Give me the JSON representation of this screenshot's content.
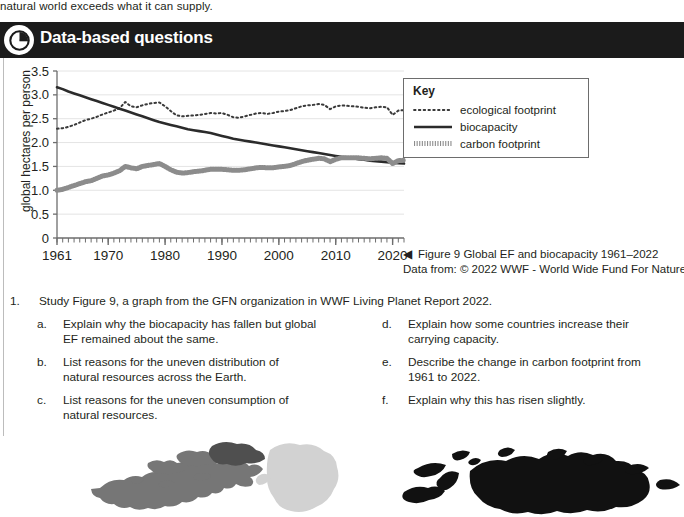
{
  "top_text": "natural world exceeds what it can supply.",
  "header": {
    "title": "Data-based questions",
    "icon": "pie-chart-icon"
  },
  "chart_data": {
    "type": "line",
    "title": "Global EF and biocapacity 1961–2022",
    "xlabel": "",
    "ylabel": "global hectares per person",
    "xlim": [
      1961,
      2022
    ],
    "ylim": [
      0,
      3.5
    ],
    "yticks": [
      "0",
      "0.5",
      "1.0",
      "1.5",
      "2.0",
      "2.5",
      "3.0",
      "3.5"
    ],
    "xticks": [
      "1961",
      "1970",
      "1980",
      "1990",
      "2000",
      "2010",
      "2020"
    ],
    "grid": true,
    "legend_position": "right",
    "x": [
      1961,
      1962,
      1963,
      1964,
      1965,
      1966,
      1967,
      1968,
      1969,
      1970,
      1971,
      1972,
      1973,
      1974,
      1975,
      1976,
      1977,
      1978,
      1979,
      1980,
      1981,
      1982,
      1983,
      1984,
      1985,
      1986,
      1987,
      1988,
      1989,
      1990,
      1991,
      1992,
      1993,
      1994,
      1995,
      1996,
      1997,
      1998,
      1999,
      2000,
      2001,
      2002,
      2003,
      2004,
      2005,
      2006,
      2007,
      2008,
      2009,
      2010,
      2011,
      2012,
      2013,
      2014,
      2015,
      2016,
      2017,
      2018,
      2019,
      2020,
      2021,
      2022
    ],
    "series": [
      {
        "name": "ecological footprint",
        "style": "dotted",
        "values": [
          2.29,
          2.3,
          2.33,
          2.37,
          2.42,
          2.47,
          2.5,
          2.54,
          2.59,
          2.63,
          2.67,
          2.72,
          2.85,
          2.76,
          2.74,
          2.78,
          2.81,
          2.83,
          2.84,
          2.76,
          2.66,
          2.57,
          2.55,
          2.56,
          2.57,
          2.58,
          2.6,
          2.62,
          2.61,
          2.62,
          2.58,
          2.53,
          2.52,
          2.55,
          2.58,
          2.61,
          2.62,
          2.6,
          2.62,
          2.65,
          2.66,
          2.68,
          2.72,
          2.76,
          2.78,
          2.79,
          2.81,
          2.79,
          2.7,
          2.76,
          2.78,
          2.77,
          2.76,
          2.75,
          2.73,
          2.72,
          2.74,
          2.75,
          2.74,
          2.58,
          2.67,
          2.68
        ]
      },
      {
        "name": "biocapacity",
        "style": "solid",
        "values": [
          3.16,
          3.12,
          3.07,
          3.03,
          2.99,
          2.95,
          2.91,
          2.87,
          2.83,
          2.79,
          2.75,
          2.71,
          2.67,
          2.63,
          2.59,
          2.55,
          2.51,
          2.47,
          2.43,
          2.4,
          2.37,
          2.34,
          2.31,
          2.28,
          2.26,
          2.24,
          2.22,
          2.2,
          2.17,
          2.14,
          2.11,
          2.08,
          2.06,
          2.04,
          2.02,
          2.0,
          1.98,
          1.96,
          1.94,
          1.92,
          1.9,
          1.88,
          1.86,
          1.84,
          1.82,
          1.8,
          1.78,
          1.76,
          1.74,
          1.72,
          1.7,
          1.69,
          1.67,
          1.65,
          1.64,
          1.62,
          1.61,
          1.6,
          1.59,
          1.58,
          1.57,
          1.56
        ]
      },
      {
        "name": "carbon footprint",
        "style": "hatched",
        "values": [
          1.0,
          1.02,
          1.06,
          1.1,
          1.14,
          1.18,
          1.2,
          1.25,
          1.3,
          1.32,
          1.36,
          1.41,
          1.5,
          1.47,
          1.45,
          1.5,
          1.52,
          1.54,
          1.56,
          1.5,
          1.43,
          1.38,
          1.36,
          1.37,
          1.39,
          1.4,
          1.42,
          1.44,
          1.44,
          1.44,
          1.43,
          1.42,
          1.42,
          1.43,
          1.45,
          1.47,
          1.48,
          1.47,
          1.47,
          1.49,
          1.5,
          1.52,
          1.56,
          1.6,
          1.63,
          1.65,
          1.67,
          1.66,
          1.6,
          1.65,
          1.68,
          1.68,
          1.68,
          1.68,
          1.67,
          1.66,
          1.67,
          1.68,
          1.67,
          1.56,
          1.62,
          1.63
        ]
      }
    ]
  },
  "key": {
    "title": "Key",
    "items": [
      {
        "label": "ecological footprint",
        "style": "dotted"
      },
      {
        "label": "biocapacity",
        "style": "solid"
      },
      {
        "label": "carbon footprint",
        "style": "hatched"
      }
    ]
  },
  "caption": {
    "arrow": "◀",
    "line1": "Figure 9 Global EF and biocapacity 1961–2022",
    "line2": "Data from: © 2022 WWF - World Wide Fund For Nature"
  },
  "questions": {
    "number": "1.",
    "stem": "Study Figure 9, a graph from the GFN organization in WWF Living Planet Report 2022.",
    "left_column": [
      {
        "letter": "a.",
        "text": "Explain why the biocapacity has fallen but global EF remained about the same."
      },
      {
        "letter": "b.",
        "text": "List reasons for the uneven distribution of natural resources across the Earth."
      },
      {
        "letter": "c.",
        "text": "List reasons for the uneven consumption of natural resources."
      }
    ],
    "right_column": [
      {
        "letter": "d.",
        "text": "Explain how some countries increase their carrying capacity."
      },
      {
        "letter": "e.",
        "text": "Describe the change in carbon footprint from 1961 to 2022."
      },
      {
        "letter": "f.",
        "text": "Explain why this has risen slightly."
      }
    ]
  },
  "colors": {
    "header_bar": "#1b1b1b",
    "text": "#231f20",
    "gridline": "#e4e4e4",
    "axis": "#6d6d6d",
    "map_dark": "#111111",
    "map_mid": "#767676",
    "map_light": "#d2d2d2"
  }
}
